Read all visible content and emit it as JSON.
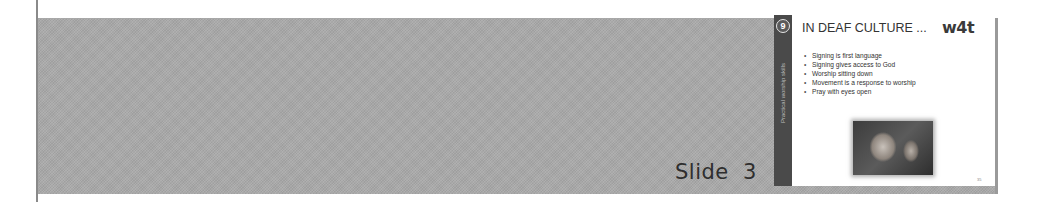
{
  "page": {
    "slide_label": "Slide  3"
  },
  "thumbnail": {
    "section_badge": "9",
    "side_text": "Practical worship skills",
    "title": "IN DEAF CULTURE ...",
    "logo": "w4t",
    "bullets": [
      "Signing is first language",
      "Signing gives access to God",
      "Worship sitting down",
      "Movement is a response to worship",
      "Pray with eyes open"
    ],
    "photo_alt": "person signing",
    "page_number": "35"
  },
  "colors": {
    "band": "#a9a9a9",
    "side_strip": "#4a4a4a",
    "slide_bg": "#ffffff",
    "text": "#333333"
  }
}
